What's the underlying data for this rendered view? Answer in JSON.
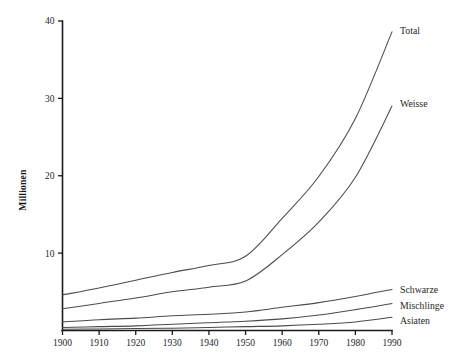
{
  "chart_data": {
    "type": "line",
    "title": "",
    "subtitle": "",
    "xlabel": "",
    "ylabel": "Millionen",
    "x": [
      1900,
      1910,
      1920,
      1930,
      1940,
      1950,
      1960,
      1970,
      1980,
      1990
    ],
    "xlim": [
      1900,
      1990
    ],
    "ylim": [
      0,
      40
    ],
    "grid": false,
    "legend_position": "right-inline-labels",
    "xticks": [
      "1900",
      "1910",
      "1920",
      "1930",
      "1940",
      "1950",
      "1960",
      "1970",
      "1980",
      "1990"
    ],
    "yticks": [
      "10",
      "20",
      "30",
      "40"
    ],
    "ytick_values": [
      10,
      20,
      30,
      40
    ],
    "series": [
      {
        "name": "Total",
        "label": "Total",
        "color": "#4a4a52",
        "values": [
          4.6,
          5.5,
          6.5,
          7.5,
          8.4,
          9.6,
          14.5,
          19.9,
          27.4,
          38.6
        ]
      },
      {
        "name": "Weisse",
        "label": "Weisse",
        "color": "#4a4a52",
        "values": [
          2.8,
          3.5,
          4.2,
          5.0,
          5.6,
          6.4,
          9.8,
          14.0,
          19.8,
          29.0
        ]
      },
      {
        "name": "Schwarze",
        "label": "Schwarze",
        "color": "#4a4a52",
        "values": [
          1.1,
          1.4,
          1.6,
          1.9,
          2.1,
          2.4,
          3.0,
          3.6,
          4.4,
          5.3
        ]
      },
      {
        "name": "Mischlinge",
        "label": "Mischlinge",
        "color": "#4a4a52",
        "values": [
          0.4,
          0.5,
          0.6,
          0.8,
          1.0,
          1.2,
          1.5,
          2.0,
          2.7,
          3.5
        ]
      },
      {
        "name": "Asiaten",
        "label": "Asiaten",
        "color": "#4a4a52",
        "values": [
          0.15,
          0.2,
          0.25,
          0.3,
          0.4,
          0.5,
          0.6,
          0.8,
          1.1,
          1.7
        ]
      }
    ]
  }
}
